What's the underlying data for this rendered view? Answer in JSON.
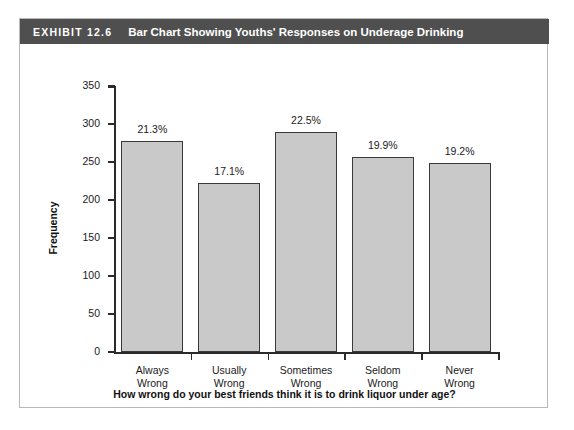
{
  "exhibit": {
    "number": "EXHIBIT 12.6",
    "title": "Bar Chart Showing Youths' Responses on Underage Drinking"
  },
  "chart_data": {
    "type": "bar",
    "title": "Bar Chart Showing Youths' Responses on Underage Drinking",
    "categories": [
      "Always Wrong",
      "Usually Wrong",
      "Sometimes Wrong",
      "Seldom Wrong",
      "Never Wrong"
    ],
    "category_lines": [
      [
        "Always",
        "Wrong"
      ],
      [
        "Usually",
        "Wrong"
      ],
      [
        "Sometimes",
        "Wrong"
      ],
      [
        "Seldom",
        "Wrong"
      ],
      [
        "Never",
        "Wrong"
      ]
    ],
    "values": [
      277,
      222,
      290,
      257,
      249
    ],
    "data_labels": [
      "21.3%",
      "17.1%",
      "22.5%",
      "19.9%",
      "19.2%"
    ],
    "xlabel": "How wrong do your best friends think it is to drink liquor under age?",
    "ylabel": "Frequency",
    "ylim": [
      0,
      350
    ],
    "yticks": [
      0,
      50,
      100,
      150,
      200,
      250,
      300,
      350
    ],
    "ytick_labels": [
      "0",
      "50",
      "100",
      "150",
      "200",
      "250",
      "300",
      "350"
    ],
    "grid": false,
    "legend": false,
    "bar_fill_color": "#c9c9c9",
    "bar_edge_color": "#3a3a3a",
    "header_color": "#4f4f4f"
  }
}
